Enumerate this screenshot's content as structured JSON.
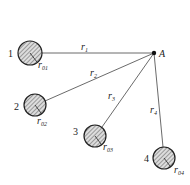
{
  "diagram": {
    "point": {
      "label": "A",
      "x": 154,
      "y": 53
    },
    "sources": [
      {
        "id": "1",
        "cx": 30,
        "cy": 53,
        "r": 12,
        "radius_label": "r",
        "radius_sub": "01",
        "dist_label": "r",
        "dist_sub": "1"
      },
      {
        "id": "2",
        "cx": 35,
        "cy": 105,
        "r": 11,
        "radius_label": "r",
        "radius_sub": "02",
        "dist_label": "r",
        "dist_sub": "2"
      },
      {
        "id": "3",
        "cx": 95,
        "cy": 136,
        "r": 11,
        "radius_label": "r",
        "radius_sub": "03",
        "dist_label": "r",
        "dist_sub": "3"
      },
      {
        "id": "4",
        "cx": 164,
        "cy": 158,
        "r": 11,
        "radius_label": "r",
        "radius_sub": "04",
        "dist_label": "r",
        "dist_sub": "4"
      }
    ]
  }
}
